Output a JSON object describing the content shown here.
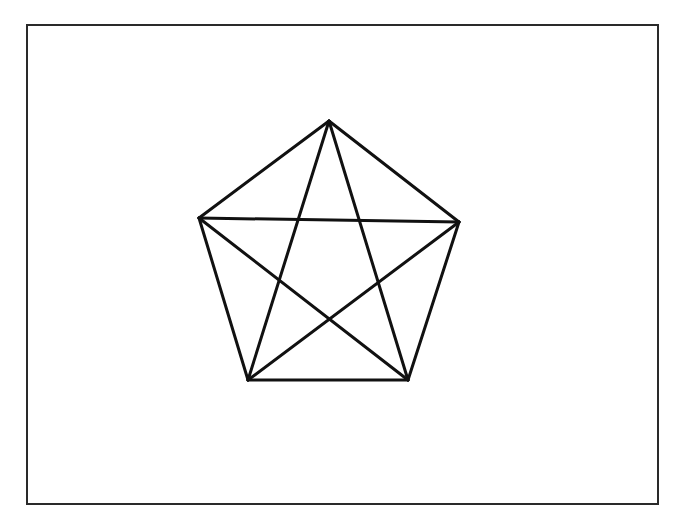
{
  "diagram": {
    "type": "complete-graph-K5-pentagon",
    "stroke_color": "#111111",
    "frame_color": "#2a2a2a",
    "vertices": [
      {
        "id": "top",
        "x": 329,
        "y": 121
      },
      {
        "id": "right",
        "x": 459,
        "y": 222
      },
      {
        "id": "bottom-right",
        "x": 408,
        "y": 380
      },
      {
        "id": "bottom-left",
        "x": 248,
        "y": 380
      },
      {
        "id": "left",
        "x": 199,
        "y": 218
      }
    ],
    "edges": [
      [
        "top",
        "right"
      ],
      [
        "right",
        "bottom-right"
      ],
      [
        "bottom-right",
        "bottom-left"
      ],
      [
        "bottom-left",
        "left"
      ],
      [
        "left",
        "top"
      ],
      [
        "top",
        "bottom-right"
      ],
      [
        "top",
        "bottom-left"
      ],
      [
        "left",
        "right"
      ],
      [
        "left",
        "bottom-right"
      ],
      [
        "right",
        "bottom-left"
      ]
    ]
  }
}
